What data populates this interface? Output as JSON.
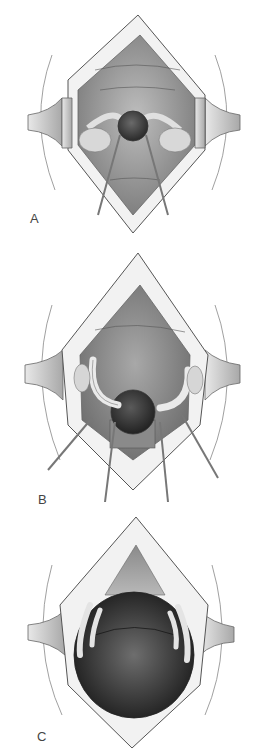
{
  "figure": {
    "panels": [
      {
        "label": "A",
        "description": "Incision retracted, dark dome structure with paired tubular structures at center, forceps below"
      },
      {
        "label": "B",
        "description": "Tubular structures looped around dark dome, four forceps retracting"
      },
      {
        "label": "C",
        "description": "Large dark spherical structure filling incision with tubular structures at sides"
      }
    ]
  },
  "colors": {
    "background": "#ffffff",
    "outline": "#555555",
    "tissue_light": "#eeeeee",
    "organ_mid": "#9a9a9a",
    "organ_dark": "#3a3a3a",
    "retractor": "#cfcfcf"
  }
}
